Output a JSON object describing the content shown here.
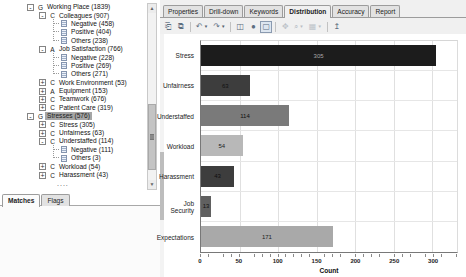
{
  "left_panel": {
    "tree": {
      "items": [
        {
          "level": 0,
          "toggle": "-",
          "icon": "G",
          "label": "Working Place (1839)"
        },
        {
          "level": 1,
          "toggle": "-",
          "icon": "C",
          "label": "Colleagues (907)"
        },
        {
          "level": 2,
          "toggle": null,
          "icon": "doc",
          "label": "Negative (458)"
        },
        {
          "level": 2,
          "toggle": null,
          "icon": "doc",
          "label": "Positive (404)"
        },
        {
          "level": 2,
          "toggle": null,
          "icon": "doc",
          "label": "Others (238)"
        },
        {
          "level": 1,
          "toggle": "-",
          "icon": "A",
          "label": "Job Satisfaction (766)"
        },
        {
          "level": 2,
          "toggle": null,
          "icon": "doc",
          "label": "Negative (228)"
        },
        {
          "level": 2,
          "toggle": null,
          "icon": "doc",
          "label": "Positive (269)"
        },
        {
          "level": 2,
          "toggle": null,
          "icon": "doc",
          "label": "Others (271)"
        },
        {
          "level": 1,
          "toggle": "+",
          "icon": "C",
          "label": "Work Environment (53)"
        },
        {
          "level": 1,
          "toggle": "+",
          "icon": "A",
          "label": "Equipment (153)"
        },
        {
          "level": 1,
          "toggle": "+",
          "icon": "C",
          "label": "Teamwork (676)"
        },
        {
          "level": 1,
          "toggle": "+",
          "icon": "C",
          "label": "Patient Care (319)"
        },
        {
          "level": 0,
          "toggle": "-",
          "icon": "G",
          "label": "Stresses (576)",
          "selected": true
        },
        {
          "level": 1,
          "toggle": "+",
          "icon": "C",
          "label": "Stress (305)"
        },
        {
          "level": 1,
          "toggle": "+",
          "icon": "C",
          "label": "Unfairness (63)"
        },
        {
          "level": 1,
          "toggle": "-",
          "icon": "C",
          "label": "Understaffed (114)"
        },
        {
          "level": 2,
          "toggle": null,
          "icon": "doc",
          "label": "Negative (111)"
        },
        {
          "level": 2,
          "toggle": null,
          "icon": "doc",
          "label": "Others (3)"
        },
        {
          "level": 1,
          "toggle": "+",
          "icon": "C",
          "label": "Workload (54)"
        },
        {
          "level": 1,
          "toggle": "+",
          "icon": "C",
          "label": "Harassment (43)"
        },
        {
          "level": 0,
          "toggle": null,
          "icon": null,
          "label": "....",
          "ellipsis": true
        }
      ]
    },
    "tabs": [
      {
        "label": "Matches",
        "active": true
      },
      {
        "label": "Flags",
        "active": false
      }
    ]
  },
  "right_panel": {
    "tabs": [
      {
        "label": "Properties",
        "active": false
      },
      {
        "label": "Drill-down",
        "active": false
      },
      {
        "label": "Keywords",
        "active": false
      },
      {
        "label": "Distribution",
        "active": true
      },
      {
        "label": "Accuracy",
        "active": false
      },
      {
        "label": "Report",
        "active": false
      }
    ],
    "toolbar": {
      "icons": [
        {
          "name": "new-document-icon",
          "glyph": "⎗"
        },
        {
          "name": "copy-icon",
          "glyph": "⧉"
        },
        {
          "name": "undo-icon",
          "glyph": "↶",
          "dropdown": true
        },
        {
          "name": "redo-icon",
          "glyph": "↷",
          "dropdown": true
        },
        {
          "name": "save-icon",
          "glyph": "◫"
        },
        {
          "name": "refresh-icon",
          "glyph": "●"
        },
        {
          "name": "select-tool-icon",
          "glyph": "▢",
          "pressed": true
        },
        {
          "name": "pan-tool-icon",
          "glyph": "✥",
          "disabled": true
        },
        {
          "name": "zoom-tool-icon",
          "glyph": "⌕",
          "dropdown": true,
          "disabled": true
        },
        {
          "name": "chart-options-icon",
          "glyph": "▦",
          "dropdown": true,
          "disabled": true
        },
        {
          "name": "export-icon",
          "glyph": "↥"
        }
      ]
    }
  },
  "chart_data": {
    "type": "bar",
    "orientation": "horizontal",
    "title": "",
    "categories": [
      "Stress",
      "Unfairness",
      "Understaffed",
      "Workload",
      "Harassment",
      "Job Security",
      "Expectations"
    ],
    "values": [
      305,
      63,
      114,
      54,
      43,
      13,
      171
    ],
    "bar_colors": [
      "#1c1c1c",
      "#3d3d3d",
      "#7a7a7a",
      "#b8b8b8",
      "#3d3d3d",
      "#606060",
      "#a9a9a9"
    ],
    "value_label_colors": [
      "#a8a8a8",
      "#101010",
      "#101010",
      "#222222",
      "#0e0e0e",
      "#111111",
      "#222222"
    ],
    "xlabel": "Count",
    "x_ticks": [
      0,
      50,
      100,
      150,
      200,
      250,
      300
    ],
    "xlim": [
      0,
      332
    ],
    "grid": true,
    "legend": null
  },
  "colors": {
    "selection_bg": "#a6a6a6",
    "tab_inactive_bg": "#e2e2e2",
    "panel_bg": "#f0f0f0",
    "gridline": "#e0e0e0",
    "axis": "#787878"
  }
}
